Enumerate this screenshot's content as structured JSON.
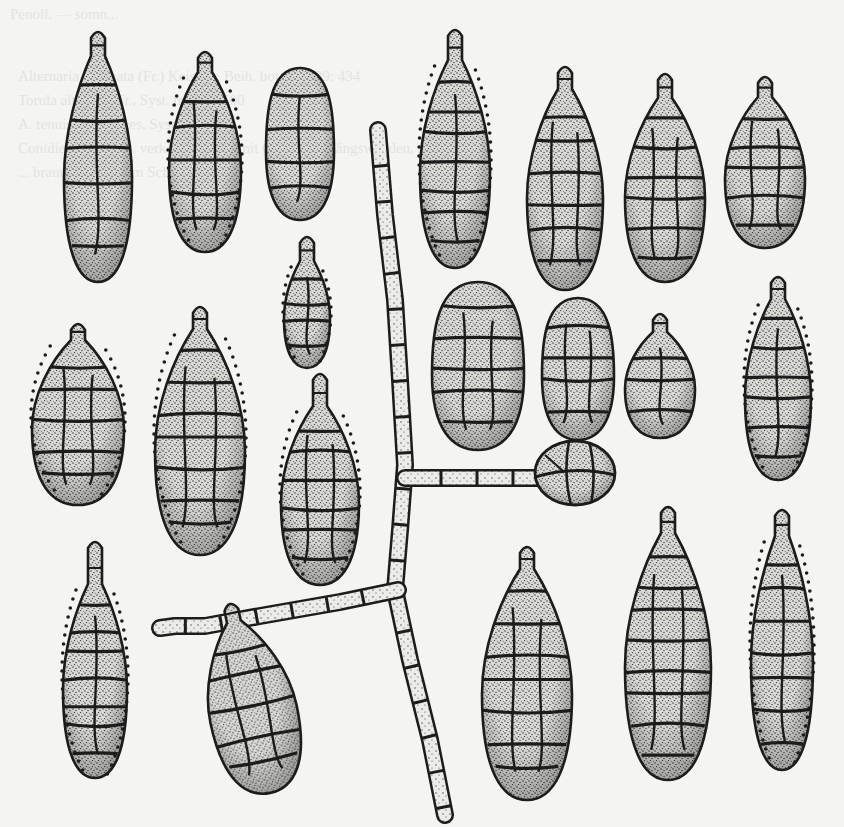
{
  "plate": {
    "subject": "Conidia and branched septate hypha (Alternaria-type), stippled ink illustration",
    "colors": {
      "paper": "#f4f4f2",
      "ink": "#1c1c1c",
      "fill": "#b9b9b6"
    },
    "bleed_through_text": [
      "Penoll. — somn...",
      "Alternaria alternata (Fr.) Keissler, Beih. bot. Zbl. 29: 434",
      "Torula alternata Fr., Syst. myc. 3: 500",
      "A. tenuis C. G. Nees, Syst. Pilze 72",
      "Conidien in Ketten, verkehrt keulig, mit Quer- und Längswänden, ...",
      "... braun, mit kurzem Schnabel ..."
    ]
  },
  "spores": [
    {
      "id": "s1",
      "cx": 98,
      "top": 30,
      "bottom": 282,
      "w": 68,
      "beak": 22,
      "rows": 7,
      "warty": false,
      "tilt": 0
    },
    {
      "id": "s2",
      "cx": 205,
      "top": 50,
      "bottom": 252,
      "w": 72,
      "beak": 18,
      "rows": 6,
      "warty": true,
      "tilt": 0
    },
    {
      "id": "s3",
      "cx": 300,
      "top": 68,
      "bottom": 220,
      "w": 68,
      "beak": 0,
      "rows": 5,
      "warty": false,
      "tilt": 0
    },
    {
      "id": "s4",
      "cx": 455,
      "top": 28,
      "bottom": 268,
      "w": 70,
      "beak": 28,
      "rows": 8,
      "warty": true,
      "tilt": 0
    },
    {
      "id": "s5",
      "cx": 565,
      "top": 65,
      "bottom": 290,
      "w": 76,
      "beak": 20,
      "rows": 7,
      "warty": false,
      "tilt": 0
    },
    {
      "id": "s6",
      "cx": 665,
      "top": 72,
      "bottom": 282,
      "w": 80,
      "beak": 22,
      "rows": 7,
      "warty": false,
      "tilt": 0
    },
    {
      "id": "s7",
      "cx": 765,
      "top": 75,
      "bottom": 248,
      "w": 80,
      "beak": 18,
      "rows": 6,
      "warty": false,
      "tilt": 0
    },
    {
      "id": "s8",
      "cx": 78,
      "top": 322,
      "bottom": 505,
      "w": 92,
      "beak": 14,
      "rows": 6,
      "warty": true,
      "tilt": 0
    },
    {
      "id": "s9",
      "cx": 200,
      "top": 305,
      "bottom": 555,
      "w": 90,
      "beak": 20,
      "rows": 8,
      "warty": true,
      "tilt": 0
    },
    {
      "id": "s10",
      "cx": 307,
      "top": 235,
      "bottom": 368,
      "w": 46,
      "beak": 22,
      "rows": 5,
      "warty": true,
      "tilt": 0
    },
    {
      "id": "s11",
      "cx": 320,
      "top": 372,
      "bottom": 585,
      "w": 78,
      "beak": 30,
      "rows": 7,
      "warty": true,
      "tilt": 0
    },
    {
      "id": "s12",
      "cx": 478,
      "top": 282,
      "bottom": 450,
      "w": 92,
      "beak": 0,
      "rows": 6,
      "warty": false,
      "tilt": 0
    },
    {
      "id": "s13",
      "cx": 578,
      "top": 298,
      "bottom": 440,
      "w": 72,
      "beak": 0,
      "rows": 5,
      "warty": false,
      "tilt": 0
    },
    {
      "id": "s14",
      "cx": 660,
      "top": 312,
      "bottom": 438,
      "w": 70,
      "beak": 16,
      "rows": 4,
      "warty": false,
      "tilt": 0
    },
    {
      "id": "s15",
      "cx": 778,
      "top": 275,
      "bottom": 480,
      "w": 66,
      "beak": 20,
      "rows": 7,
      "warty": true,
      "tilt": 0
    },
    {
      "id": "s16",
      "cx": 95,
      "top": 540,
      "bottom": 778,
      "w": 64,
      "beak": 40,
      "rows": 8,
      "warty": true,
      "tilt": 0
    },
    {
      "id": "s17",
      "cx": 250,
      "top": 600,
      "bottom": 795,
      "w": 88,
      "beak": 16,
      "rows": 6,
      "warty": false,
      "tilt": -12
    },
    {
      "id": "s18",
      "cx": 527,
      "top": 545,
      "bottom": 800,
      "w": 90,
      "beak": 20,
      "rows": 8,
      "warty": false,
      "tilt": 0
    },
    {
      "id": "s19",
      "cx": 668,
      "top": 505,
      "bottom": 780,
      "w": 86,
      "beak": 24,
      "rows": 9,
      "warty": false,
      "tilt": 0
    },
    {
      "id": "s20",
      "cx": 782,
      "top": 508,
      "bottom": 770,
      "w": 62,
      "beak": 24,
      "rows": 8,
      "warty": true,
      "tilt": 0
    }
  ],
  "terminal_spore": {
    "cx": 575,
    "cy": 473,
    "rx": 40,
    "ry": 32
  },
  "hypha": {
    "main": [
      [
        378,
        130
      ],
      [
        385,
        215
      ],
      [
        395,
        300
      ],
      [
        400,
        380
      ],
      [
        405,
        465
      ],
      [
        400,
        530
      ],
      [
        395,
        590
      ],
      [
        410,
        660
      ],
      [
        430,
        740
      ],
      [
        445,
        815
      ]
    ],
    "branch_right": [
      [
        405,
        478
      ],
      [
        440,
        478
      ],
      [
        538,
        478
      ]
    ],
    "branch_left": [
      [
        398,
        590
      ],
      [
        340,
        602
      ],
      [
        260,
        616
      ],
      [
        205,
        626
      ],
      [
        175,
        626
      ],
      [
        160,
        628
      ]
    ],
    "width": 18
  }
}
